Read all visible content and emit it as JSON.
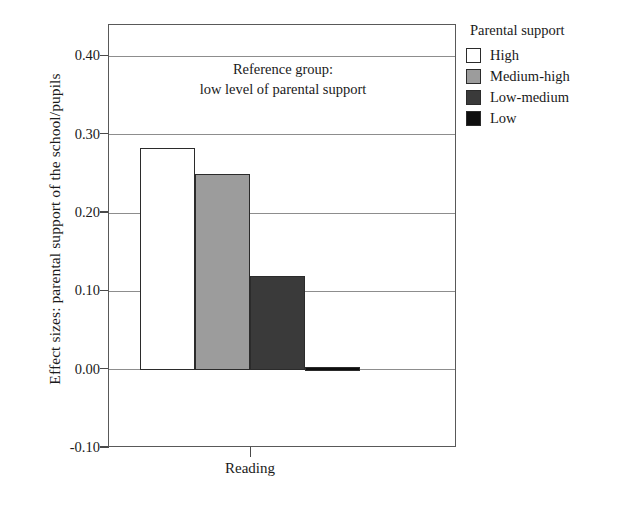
{
  "chart_data": {
    "type": "bar",
    "title": "",
    "subtitle": "",
    "xlabel": "",
    "ylabel": "Effect sizes: parental support of the school/pupils",
    "categories": [
      "Reading"
    ],
    "ylim": [
      -0.1,
      0.44
    ],
    "yticks": [
      "0.40",
      "0.30",
      "0.20",
      "0.10",
      "0.00",
      "-0.10"
    ],
    "ytick_values": [
      0.4,
      0.3,
      0.2,
      0.1,
      0.0,
      -0.1
    ],
    "grid": true,
    "legend_position": "right",
    "annotation_line1": "Reference group:",
    "annotation_line2": "low level of parental support",
    "series": [
      {
        "name": "High",
        "values": [
          0.283
        ],
        "color": "#ffffff"
      },
      {
        "name": "Medium-high",
        "values": [
          0.25
        ],
        "color": "#9c9c9c"
      },
      {
        "name": "Low-medium",
        "values": [
          0.12
        ],
        "color": "#3a3a3a"
      },
      {
        "name": "Low",
        "values": [
          0.004
        ],
        "color": "#0e0e0e"
      }
    ]
  },
  "legend": {
    "title": "Parental support",
    "items": [
      {
        "label": "High",
        "color": "#ffffff"
      },
      {
        "label": "Medium-high",
        "color": "#9c9c9c"
      },
      {
        "label": "Low-medium",
        "color": "#3a3a3a"
      },
      {
        "label": "Low",
        "color": "#0e0e0e"
      }
    ]
  },
  "axes": {
    "y_title": "Effect sizes: parental support of the school/pupils",
    "x_category": "Reading",
    "tick_labels": [
      "0.40",
      "0.30",
      "0.20",
      "0.10",
      "0.00",
      "-0.10"
    ]
  },
  "annotation": {
    "line1": "Reference group:",
    "line2": "low level of parental support"
  },
  "colors": {
    "axis": "#595959",
    "grid": "#8d8d8d",
    "text": "#1a1a1a",
    "bar_border": "#2b2b2b"
  }
}
